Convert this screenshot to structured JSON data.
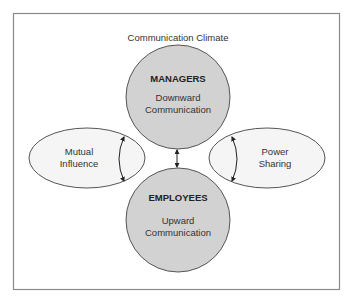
{
  "diagram": {
    "title": "Communication Climate",
    "nodes": {
      "managers": {
        "heading": "MANAGERS",
        "line1": "Downward",
        "line2": "Communication"
      },
      "employees": {
        "heading": "EMPLOYEES",
        "line1": "Upward",
        "line2": "Communication"
      },
      "mutual_influence": {
        "line1": "Mutual",
        "line2": "Influence"
      },
      "power_sharing": {
        "line1": "Power",
        "line2": "Sharing"
      }
    },
    "edges": [
      {
        "from": "managers",
        "to": "employees",
        "type": "bidirectional"
      },
      {
        "label_node": "mutual_influence",
        "type": "bidirectional-curved"
      },
      {
        "label_node": "power_sharing",
        "type": "bidirectional-curved"
      }
    ],
    "colors": {
      "frame": "#8a8a8a",
      "circle_fill": "#d2d2d2",
      "circle_stroke": "#555555",
      "ellipse_fill": "#f5f5f5",
      "ellipse_stroke": "#555555",
      "text": "#333333"
    }
  }
}
